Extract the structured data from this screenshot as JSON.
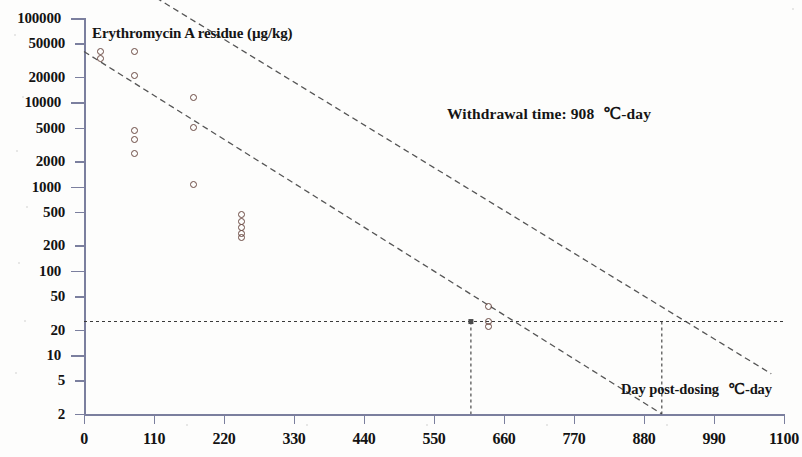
{
  "chart_data": {
    "type": "scatter",
    "title": "",
    "ylabel": "Erythromycin A residue (µg/kg)",
    "xlabel": "Day post-dosing   ℃-day",
    "xlabel_main": "Day post-dosing",
    "xlabel_unit": "℃-day",
    "yscale": "log",
    "xscale": "linear",
    "xlim": [
      0,
      1100
    ],
    "ylim": [
      2,
      100000
    ],
    "grid": false,
    "legend": null,
    "x_ticks": [
      0,
      110,
      220,
      330,
      440,
      550,
      660,
      770,
      880,
      990,
      1100
    ],
    "x_tick_labels": [
      "0",
      "110",
      "220",
      "330",
      "440",
      "550",
      "660",
      "770",
      "880",
      "990",
      "1100"
    ],
    "y_ticks": [
      2,
      5,
      10,
      20,
      50,
      100,
      200,
      500,
      1000,
      2000,
      5000,
      10000,
      20000,
      50000,
      100000
    ],
    "y_tick_labels": [
      "2",
      "5",
      "10",
      "20",
      "50",
      "100",
      "200",
      "500",
      "1000",
      "2000",
      "5000",
      "10000",
      "20000",
      "50000",
      "100000"
    ],
    "y_major_ticks": [
      10,
      100,
      1000,
      10000,
      100000
    ],
    "points": [
      {
        "x": 26,
        "y": 40000
      },
      {
        "x": 26,
        "y": 33000
      },
      {
        "x": 80,
        "y": 40000
      },
      {
        "x": 80,
        "y": 21000
      },
      {
        "x": 80,
        "y": 4600
      },
      {
        "x": 80,
        "y": 3600
      },
      {
        "x": 80,
        "y": 2500
      },
      {
        "x": 172,
        "y": 11500
      },
      {
        "x": 172,
        "y": 5000
      },
      {
        "x": 172,
        "y": 1050
      },
      {
        "x": 247,
        "y": 470
      },
      {
        "x": 247,
        "y": 390
      },
      {
        "x": 247,
        "y": 330
      },
      {
        "x": 247,
        "y": 280
      },
      {
        "x": 247,
        "y": 250
      },
      {
        "x": 635,
        "y": 38
      },
      {
        "x": 635,
        "y": 25
      },
      {
        "x": 635,
        "y": 22
      }
    ],
    "series": [
      {
        "name": "upper tolerance limit",
        "type": "line",
        "style": "dashed",
        "x": [
          100,
          1080
        ],
        "y": [
          200000,
          6.0
        ]
      },
      {
        "name": "lower tolerance limit",
        "type": "line",
        "style": "dashed",
        "x": [
          0,
          908
        ],
        "y": [
          40000,
          2.0
        ]
      }
    ],
    "reference_lines": [
      {
        "name": "mrl-horizontal",
        "orientation": "horizontal",
        "y": 25,
        "style": "dotted",
        "label": ""
      },
      {
        "name": "lower-limit-vertical",
        "orientation": "vertical",
        "x": 608,
        "style": "dotted",
        "label": ""
      },
      {
        "name": "withdrawal-time-vertical",
        "orientation": "vertical",
        "x": 908,
        "style": "dotted",
        "label": ""
      }
    ],
    "annotations": [
      {
        "name": "withdrawal-time",
        "text": "Withdrawal time: 908   ℃-day",
        "x": 620,
        "y": 9000
      }
    ]
  },
  "labels": {
    "y_axis_title": "Erythromycin A residue (µg/kg)",
    "withdrawal_annotation_text": "Withdrawal time: 908",
    "withdrawal_annotation_unit": "℃-day",
    "x_axis_title_main": "Day post-dosing",
    "x_axis_title_unit": "℃-day"
  },
  "style": {
    "axis_color": "#7b7f9e",
    "point_color": "#6b4a43",
    "line_color": "#555555",
    "text_color": "#131313",
    "background": "#fdfdfc"
  }
}
